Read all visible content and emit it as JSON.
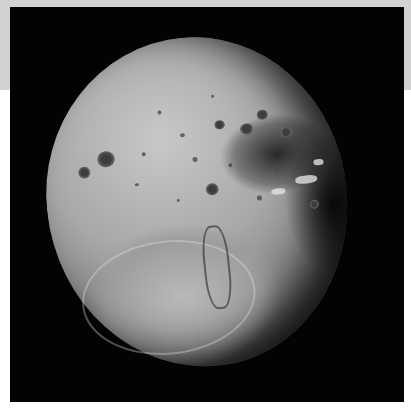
{
  "image": {
    "subject": "moon",
    "description": "Grayscale photograph of a cratered moon against a black background",
    "background_color": "#030303",
    "frame_top_band_color": "#d2d2d2",
    "frame_color": "#ffffff"
  }
}
